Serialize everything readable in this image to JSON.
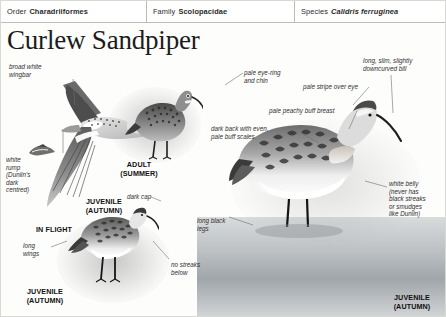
{
  "taxonomy": [
    {
      "key": "Order",
      "value": "Charadriiformes",
      "italic": false
    },
    {
      "key": "Family",
      "value": "Scolopacidae",
      "italic": false
    },
    {
      "key": "Species",
      "value": "Calidris ferruginea",
      "italic": true
    }
  ],
  "title": "Curlew Sandpiper",
  "annotations": {
    "broad_white_wingbar": "broad white\nwingbar",
    "white_rump": "white\nrump\n(Dunlin's\ndark\ncentred)",
    "long_wings": "long\nwings",
    "dark_cap": "dark cap",
    "no_streaks_below": "no streaks\nbelow",
    "pale_eye_ring_and_chin": "pale eye-ring\nand chin",
    "dark_back_scales": "dark back with even,\npale buff scales",
    "pale_stripe_over_eye": "pale stripe over eye",
    "pale_peachy_buff_breast": "pale peachy buff breast",
    "downcurved_bill": "long, slim, slightly\ndowncurved bill",
    "white_belly": "white belly\n(never has\nblack streaks\nor smudges\nlike Dunlin)",
    "long_black_legs": "long black\nlegs"
  },
  "captions": {
    "in_flight": "IN FLIGHT",
    "juvenile_autumn_flight": "JUVENILE\n(AUTUMN)",
    "adult_summer": "ADULT\n(SUMMER)",
    "juvenile_autumn_standing": "JUVENILE\n(AUTUMN)",
    "juvenile_autumn_water": "JUVENILE\n(AUTUMN)"
  },
  "colors": {
    "text": "#2f2f2f",
    "caption": "#111111",
    "rule": "#bcbcb8",
    "leader": "#6e6e6e",
    "plumage_dark": "#3a3a3a",
    "plumage_mid": "#7d7d7d",
    "plumage_light": "#d9d9d9"
  }
}
